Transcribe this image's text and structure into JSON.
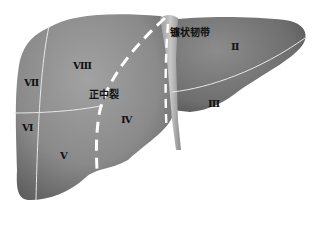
{
  "diagram": {
    "colors": {
      "liver_fill_light": "#8f8f8f",
      "liver_fill_dark": "#5a5a5a",
      "ligament": "#b4b4b4",
      "boundary_line": "#e6e6e6",
      "fissure_dashes": "#ffffff",
      "label_text": "#111111"
    },
    "labels": {
      "falciform_ligament": "镰状韧带",
      "median_fissure": "正中裂",
      "segment_2": "Ⅱ",
      "segment_3": "Ⅲ",
      "segment_4": "Ⅳ",
      "segment_5": "Ⅴ",
      "segment_6": "Ⅵ",
      "segment_7": "Ⅶ",
      "segment_8": "Ⅷ"
    }
  }
}
